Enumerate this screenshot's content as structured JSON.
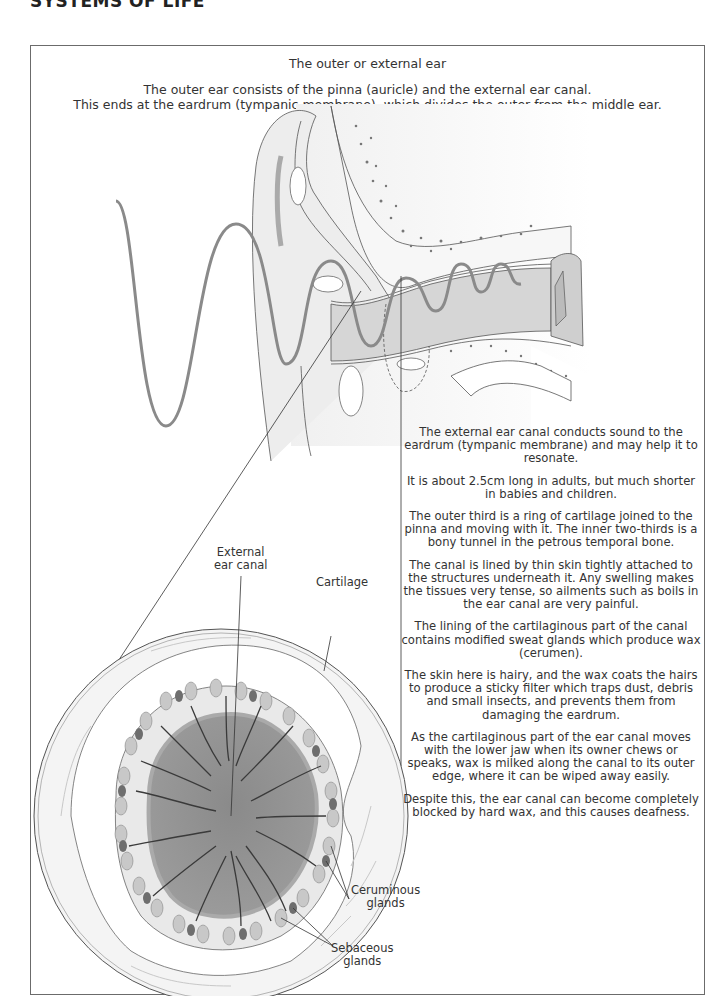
{
  "page": {
    "header": "SYSTEMS OF LIFE"
  },
  "section": {
    "title": "The outer or external ear",
    "intro_line1": "The outer ear consists of the pinna (auricle) and the external ear canal.",
    "intro_line2": "This ends at the eardrum (tympanic membrane), which divides the outer from the middle ear."
  },
  "diagram_labels": {
    "external_ear_canal_1": "External",
    "external_ear_canal_2": "ear canal",
    "cartilage": "Cartilage",
    "ceruminous_1": "Ceruminous",
    "ceruminous_2": "glands",
    "sebaceous_1": "Sebaceous",
    "sebaceous_2": "glands"
  },
  "body_text": [
    "The external ear canal conducts sound to the eardrum (tympanic membrane) and may help it to resonate.",
    "It is about 2.5cm long in adults, but much shorter in babies and children.",
    "The outer third is a ring of cartilage joined to the pinna and moving with it. The inner two-thirds is a bony tunnel in the petrous temporal bone.",
    "The canal is lined by thin skin tightly attached to the structures underneath it. Any swelling makes the tissues very tense, so ailments such as boils in the ear canal are very painful.",
    "The lining of the cartilaginous part of the canal contains modified sweat glands which produce wax (cerumen).",
    "The skin here is hairy, and the wax coats the hairs to produce a sticky filter which traps dust, debris and small insects, and prevents them from damaging the eardrum.",
    "As the cartilaginous part of the ear canal moves with the lower jaw when its owner chews or speaks, wax is milked along the canal to its outer edge, where it can be wiped away easily.",
    "Despite this, the ear canal can become completely blocked by hard wax, and this causes deafness."
  ],
  "colors": {
    "frame_border": "#6b6b6b",
    "sound_wave": "#8a8a8a",
    "tissue_light": "#ececec",
    "tissue_mid": "#d6d6d6",
    "canal_dark": "#8f8f8f",
    "hair": "#3a3a3a",
    "gland_dark": "#6e6e6e"
  }
}
